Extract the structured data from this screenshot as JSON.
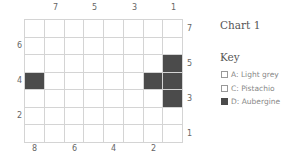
{
  "title": "Chart 1",
  "key_label": "Key",
  "legend": [
    {
      "label": "A: Light grey",
      "color": "#ffffff"
    },
    {
      "label": "C: Pistachio",
      "color": "#ffffff"
    },
    {
      "label": "D: Aubergine",
      "color": "#4b4b4b"
    }
  ],
  "grid": {
    "columns": 8,
    "rows": 7,
    "filled_cells": [
      {
        "row": 2,
        "col": 7
      },
      {
        "row": 3,
        "col": 0
      },
      {
        "row": 3,
        "col": 6
      },
      {
        "row": 3,
        "col": 7
      },
      {
        "row": 4,
        "col": 7
      }
    ],
    "fill_color": "#4b4b4b",
    "top_labels": [
      "7",
      "5",
      "3",
      "1"
    ],
    "bottom_labels": [
      "8",
      "6",
      "4",
      "2"
    ],
    "left_labels": [
      "6",
      "4",
      "2"
    ],
    "right_labels": [
      "7",
      "5",
      "3",
      "1"
    ]
  }
}
